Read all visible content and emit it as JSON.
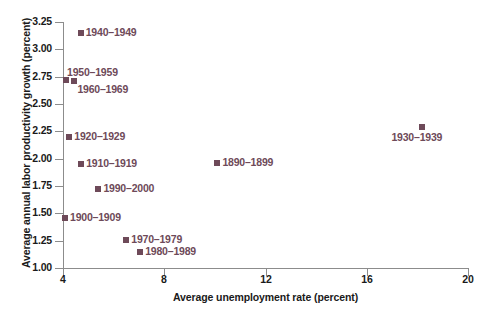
{
  "chart_data": {
    "type": "scatter",
    "title": "",
    "xlabel": "Average unemployment rate (percent)",
    "ylabel": "Average annual labor productivity growth (percent)",
    "xlim": [
      4,
      20
    ],
    "ylim": [
      1.0,
      3.25
    ],
    "xticks": [
      "4",
      "8",
      "12",
      "16",
      "20"
    ],
    "xtick_values": [
      4,
      8,
      12,
      16,
      20
    ],
    "yticks": [
      "1.00",
      "1.25",
      "1.50",
      "1.75",
      "2.00",
      "2.25",
      "2.50",
      "2.75",
      "3.00",
      "3.25"
    ],
    "ytick_values": [
      1.0,
      1.25,
      1.5,
      1.75,
      2.0,
      2.25,
      2.5,
      2.75,
      3.0,
      3.25
    ],
    "grid": false,
    "legend": "none",
    "marker_color": "#6e4a59",
    "label_color": "#6e4a59",
    "axis_color": "#8c8c8c",
    "points": [
      {
        "label": "1940–1949",
        "x": 4.7,
        "y": 3.15,
        "label_pos": "right"
      },
      {
        "label": "1950–1959",
        "x": 4.12,
        "y": 2.72,
        "label_pos": "above-right"
      },
      {
        "label": "1960–1969",
        "x": 4.45,
        "y": 2.71,
        "label_pos": "below-right"
      },
      {
        "label": "1920–1929",
        "x": 4.25,
        "y": 2.2,
        "label_pos": "right"
      },
      {
        "label": "1910–1919",
        "x": 4.72,
        "y": 1.95,
        "label_pos": "right"
      },
      {
        "label": "1990–2000",
        "x": 5.4,
        "y": 1.72,
        "label_pos": "right"
      },
      {
        "label": "1900–1909",
        "x": 4.08,
        "y": 1.46,
        "label_pos": "right"
      },
      {
        "label": "1970–1979",
        "x": 6.5,
        "y": 1.26,
        "label_pos": "right"
      },
      {
        "label": "1980–1989",
        "x": 7.05,
        "y": 1.15,
        "label_pos": "right"
      },
      {
        "label": "1890–1899",
        "x": 10.1,
        "y": 1.96,
        "label_pos": "right"
      },
      {
        "label": "1930–1939",
        "x": 18.2,
        "y": 2.29,
        "label_pos": "below-center"
      }
    ]
  }
}
